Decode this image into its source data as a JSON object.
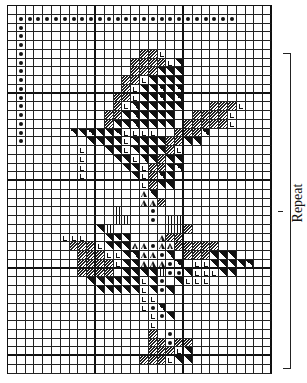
{
  "chart_data": {
    "type": "table",
    "columns": 30,
    "rows": 42,
    "legend": {
      ".": "empty",
      "o": "dot",
      "s": "hatched",
      "b": "black triangle",
      "L": "L mark",
      "A": "chevron",
      "I": "vertical bars"
    },
    "annotations": [
      "Repeat"
    ],
    "grid": [
      "..............................",
      ".ooooooooooooooooooooooooo....",
      ".o............................",
      ".o............................",
      ".o............................",
      ".o.............ssL............",
      ".o............ssssLb..........",
      ".o............sssbbb..........",
      ".o...........ssLbbbb..........",
      ".o...........sLbbbbb..........",
      ".o..........ssLbbbbb..........",
      ".o..........sLbbbbbb...sssL...",
      ".o.........ssbbbbbb..ssssL....",
      ".o.........sbbbbbbb.sssssL....",
      ".o.....bbbbbbLLLL..sssb.......",
      ".o.......bbbbLbbbbssbb........",
      "........L..bbLbbbbsL..........",
      "........L...bbLbbsbb..........",
      "........L....bbLssbb..........",
      "........L.....bLsbb...........",
      "...............Lsbb...........",
      "...............Ab.............",
      "...............AAs............",
      "............I...o.............",
      "............II..o.II..........",
      "..........bI......IIs.........",
      "......LLL..bbb...Ass..........",
      ".......sssLbbbAAoAAsssss......",
      "........sssLLbbAAob.sssbbb....",
      "........ssssLbbAAAob.LLbbbbb..",
      "........ssss.bbbbIoobLLLbb....",
      ".........bbbbbbLbo.bLLL.......",
      "..........bbbbbLbob...........",
      "...............LL.............",
      "...............Lob............",
      "................Lob...........",
      "................L.............",
      "................s.o...........",
      "................ssoss.........",
      "................sssLb.........",
      "...............sssLbb.........",
      ".............................."
    ]
  },
  "repeat_label": "Repeat"
}
